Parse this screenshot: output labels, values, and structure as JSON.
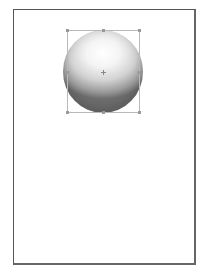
{
  "canvas": {
    "page_border_color": "#555555",
    "background": "#ffffff"
  },
  "object": {
    "type": "sphere",
    "selected": true,
    "fill": "radial-gradient-gray",
    "highlight_color": "#ffffff",
    "shadow_color": "#6e6e6e",
    "selection_box_color": "#b9b9b9"
  },
  "icons": {
    "center_marker": "crosshair-icon",
    "handles": "resize-handle-icon"
  }
}
